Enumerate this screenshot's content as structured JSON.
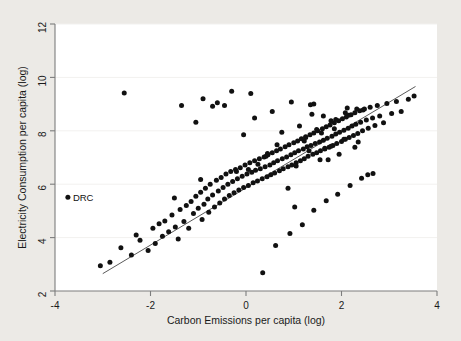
{
  "figure": {
    "background_color": "#eceae6",
    "plot_background_color": "#ffffff",
    "point_color": "#111111",
    "line_color": "#5a5a5a",
    "axis_color": "#7d7d7d",
    "grid_color": "#f2f1ef"
  },
  "chart_data": {
    "type": "scatter",
    "title": "",
    "subtitle": "",
    "xlabel": "Carbon Emissions per capita (log)",
    "ylabel": "Electricity Consumption per capita (log)",
    "xlim": [
      -4,
      4
    ],
    "ylim": [
      2,
      12
    ],
    "xticks": [
      -4,
      -2,
      0,
      2,
      4
    ],
    "yticks": [
      2,
      4,
      6,
      8,
      10,
      12
    ],
    "xticklabels": [
      "-4",
      "-2",
      "0",
      "2",
      "4"
    ],
    "yticklabels": [
      "2",
      "4",
      "6",
      "8",
      "10",
      "12"
    ],
    "grid": "horizontal-faint",
    "legend": null,
    "annotations": [
      {
        "label": "DRC",
        "x": -3.73,
        "y": 5.51,
        "marker": true
      }
    ],
    "fit_line": {
      "type": "linear",
      "x_start": -3.0,
      "y_start": 2.65,
      "x_end": 3.55,
      "y_end": 9.66,
      "slope": 1.07,
      "intercept": 5.86
    },
    "x": [
      -3.05,
      -2.85,
      -2.62,
      -2.4,
      -2.3,
      -2.22,
      -2.05,
      -1.95,
      -1.9,
      -1.82,
      -1.75,
      -1.7,
      -1.62,
      -1.55,
      -1.48,
      -1.42,
      -1.38,
      -1.3,
      -1.25,
      -1.2,
      -1.15,
      -1.1,
      -1.05,
      -1.0,
      -0.95,
      -0.92,
      -0.88,
      -0.85,
      -0.8,
      -0.78,
      -0.75,
      -0.7,
      -0.66,
      -0.62,
      -0.58,
      -0.55,
      -0.52,
      -0.48,
      -0.45,
      -0.42,
      -0.38,
      -0.35,
      -0.32,
      -0.28,
      -0.25,
      -0.22,
      -0.18,
      -0.15,
      -0.12,
      -0.08,
      -0.05,
      -0.02,
      0.02,
      0.05,
      0.08,
      0.12,
      0.15,
      0.18,
      0.2,
      0.24,
      0.28,
      0.3,
      0.34,
      0.38,
      0.4,
      0.44,
      0.46,
      0.5,
      0.52,
      0.55,
      0.58,
      0.6,
      0.64,
      0.66,
      0.7,
      0.72,
      0.76,
      0.78,
      0.82,
      0.85,
      0.88,
      0.9,
      0.94,
      0.96,
      1.0,
      1.02,
      1.05,
      1.08,
      1.1,
      1.14,
      1.16,
      1.2,
      1.22,
      1.25,
      1.28,
      1.3,
      1.34,
      1.36,
      1.4,
      1.42,
      1.45,
      1.48,
      1.5,
      1.54,
      1.56,
      1.6,
      1.62,
      1.65,
      1.68,
      1.7,
      1.74,
      1.76,
      1.8,
      1.82,
      1.85,
      1.88,
      1.9,
      1.94,
      1.96,
      2.0,
      2.02,
      2.05,
      2.08,
      2.1,
      2.14,
      2.16,
      2.2,
      2.22,
      2.25,
      2.28,
      2.3,
      2.34,
      2.38,
      2.4,
      2.44,
      2.48,
      2.52,
      2.56,
      2.6,
      2.65,
      2.7,
      2.75,
      2.8,
      2.88,
      2.95,
      3.05,
      3.15,
      3.25,
      3.4,
      3.52,
      -2.55,
      -1.35,
      -0.9,
      -0.6,
      -0.3,
      0.1,
      0.35,
      0.62,
      0.92,
      1.18,
      1.42,
      1.68,
      1.92,
      2.18,
      2.42,
      2.66,
      1.05,
      1.55,
      0.45,
      1.78,
      2.05,
      0.75,
      -0.05,
      -1.05,
      1.32,
      1.62,
      2.12,
      2.35,
      0.25,
      0.88,
      1.48,
      1.88,
      0.55,
      -0.45,
      1.72,
      2.28,
      1.12,
      1.38,
      1.95,
      2.55,
      0.18,
      -0.7,
      1.25,
      1.85,
      2.45,
      0.95,
      0.05,
      -1.5,
      1.58,
      2.08,
      1.42,
      0.65,
      -0.2,
      1.02,
      1.78,
      2.32,
      1.22,
      0.42,
      -0.95,
      1.65,
      2.15,
      1.35
    ],
    "y": [
      2.95,
      3.08,
      3.62,
      3.35,
      4.1,
      3.9,
      3.52,
      4.35,
      3.78,
      4.52,
      4.05,
      4.62,
      4.22,
      4.85,
      4.4,
      3.95,
      5.05,
      4.6,
      5.2,
      4.35,
      5.35,
      4.9,
      5.55,
      5.1,
      5.7,
      4.68,
      5.25,
      5.85,
      5.45,
      4.95,
      6.0,
      5.6,
      5.15,
      6.15,
      5.75,
      5.3,
      6.25,
      5.88,
      5.45,
      6.38,
      6.0,
      5.58,
      6.48,
      6.1,
      5.68,
      6.55,
      6.2,
      5.78,
      6.62,
      6.3,
      5.88,
      6.72,
      6.38,
      5.95,
      6.8,
      6.45,
      6.05,
      6.88,
      6.52,
      6.12,
      6.95,
      6.58,
      6.2,
      7.02,
      6.65,
      6.28,
      7.1,
      6.72,
      6.35,
      7.18,
      6.8,
      6.42,
      7.25,
      6.88,
      6.5,
      7.32,
      6.95,
      6.58,
      7.4,
      7.02,
      6.65,
      7.48,
      7.1,
      6.72,
      7.55,
      7.18,
      6.8,
      7.62,
      7.25,
      6.88,
      7.7,
      7.32,
      6.95,
      7.78,
      7.4,
      7.05,
      7.85,
      7.45,
      7.12,
      7.92,
      7.52,
      7.18,
      8.0,
      7.58,
      7.25,
      8.08,
      7.65,
      7.32,
      8.15,
      7.72,
      7.38,
      8.22,
      7.8,
      7.45,
      8.3,
      7.88,
      7.52,
      8.38,
      7.95,
      7.6,
      8.45,
      8.02,
      7.68,
      8.52,
      8.1,
      7.75,
      8.6,
      8.18,
      7.82,
      8.68,
      8.25,
      7.9,
      8.75,
      8.32,
      8.0,
      8.82,
      8.4,
      8.1,
      8.88,
      8.48,
      8.2,
      8.95,
      8.55,
      8.3,
      9.02,
      8.65,
      9.1,
      8.72,
      9.18,
      9.3,
      9.42,
      8.95,
      9.2,
      9.05,
      9.48,
      9.4,
      2.68,
      3.7,
      4.15,
      4.48,
      5.02,
      5.38,
      5.62,
      5.95,
      6.22,
      6.4,
      6.68,
      6.92,
      7.15,
      7.42,
      7.68,
      7.95,
      7.85,
      8.32,
      7.25,
      8.55,
      8.85,
      7.58,
      6.75,
      5.85,
      8.05,
      8.42,
      8.72,
      8.95,
      6.92,
      7.38,
      8.18,
      8.62,
      7.12,
      6.35,
      8.48,
      8.92,
      7.75,
      8.08,
      8.78,
      9.08,
      6.55,
      5.48,
      7.92,
      8.68,
      9.0,
      7.48,
      6.48,
      5.15,
      8.38,
      8.82,
      7.62,
      7.05,
      6.18,
      7.35,
      8.58,
      8.98,
      7.88,
      6.82,
      5.62,
      8.52,
      8.88,
      8.28
    ]
  }
}
